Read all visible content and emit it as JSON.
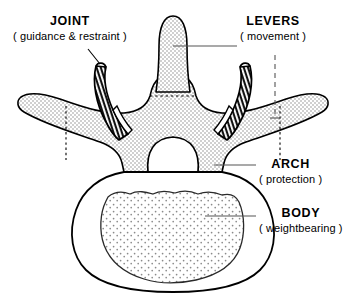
{
  "figure": {
    "width": 346,
    "height": 297,
    "background_color": "#ffffff",
    "line_color": "#000000",
    "fill_light_gray": "#e8e8e8",
    "fill_white": "#ffffff",
    "stipple_color": "#9a9a9a"
  },
  "labels": {
    "joint": {
      "title": "JOINT",
      "subtitle": "( guidance & restraint )"
    },
    "levers": {
      "title": "LEVERS",
      "subtitle": "( movement )"
    },
    "arch": {
      "title": "ARCH",
      "subtitle": "( protection )"
    },
    "body": {
      "title": "BODY",
      "subtitle": "( weightbearing )"
    }
  },
  "parts": {
    "spinous_process": "spinous-process",
    "transverse_process_left": "transverse-process-left",
    "transverse_process_right": "transverse-process-right",
    "articular_facet_left": "articular-facet-left",
    "articular_facet_right": "articular-facet-right",
    "vertebral_arch": "vertebral-arch",
    "vertebral_foramen": "vertebral-foramen",
    "vertebral_body": "vertebral-body",
    "body_cancellous_interior": "body-cancellous-interior"
  },
  "leader_lines": {
    "joint": "diagonal-line-to-left-articular-facet",
    "levers": "horizontal-line-to-spinous-process",
    "levers_dashed": "vertical-dashed-line-to-right-transverse-process",
    "arch": "horizontal-line-to-arch",
    "body": "horizontal-line-to-body-interior"
  }
}
